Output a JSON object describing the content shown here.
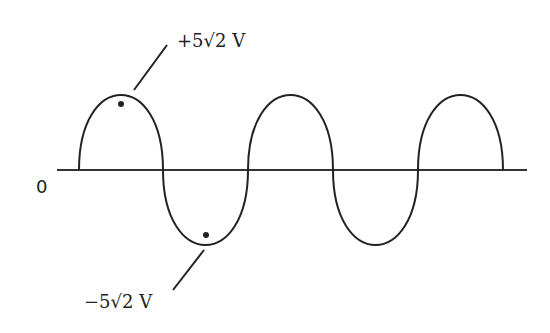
{
  "diagram": {
    "axis_origin_label": "0",
    "peak_label": "+5√2 V",
    "trough_label": "−5√2 V",
    "cycles_shown": 2.5,
    "colors": {
      "stroke": "#222222",
      "background": "#ffffff"
    }
  }
}
